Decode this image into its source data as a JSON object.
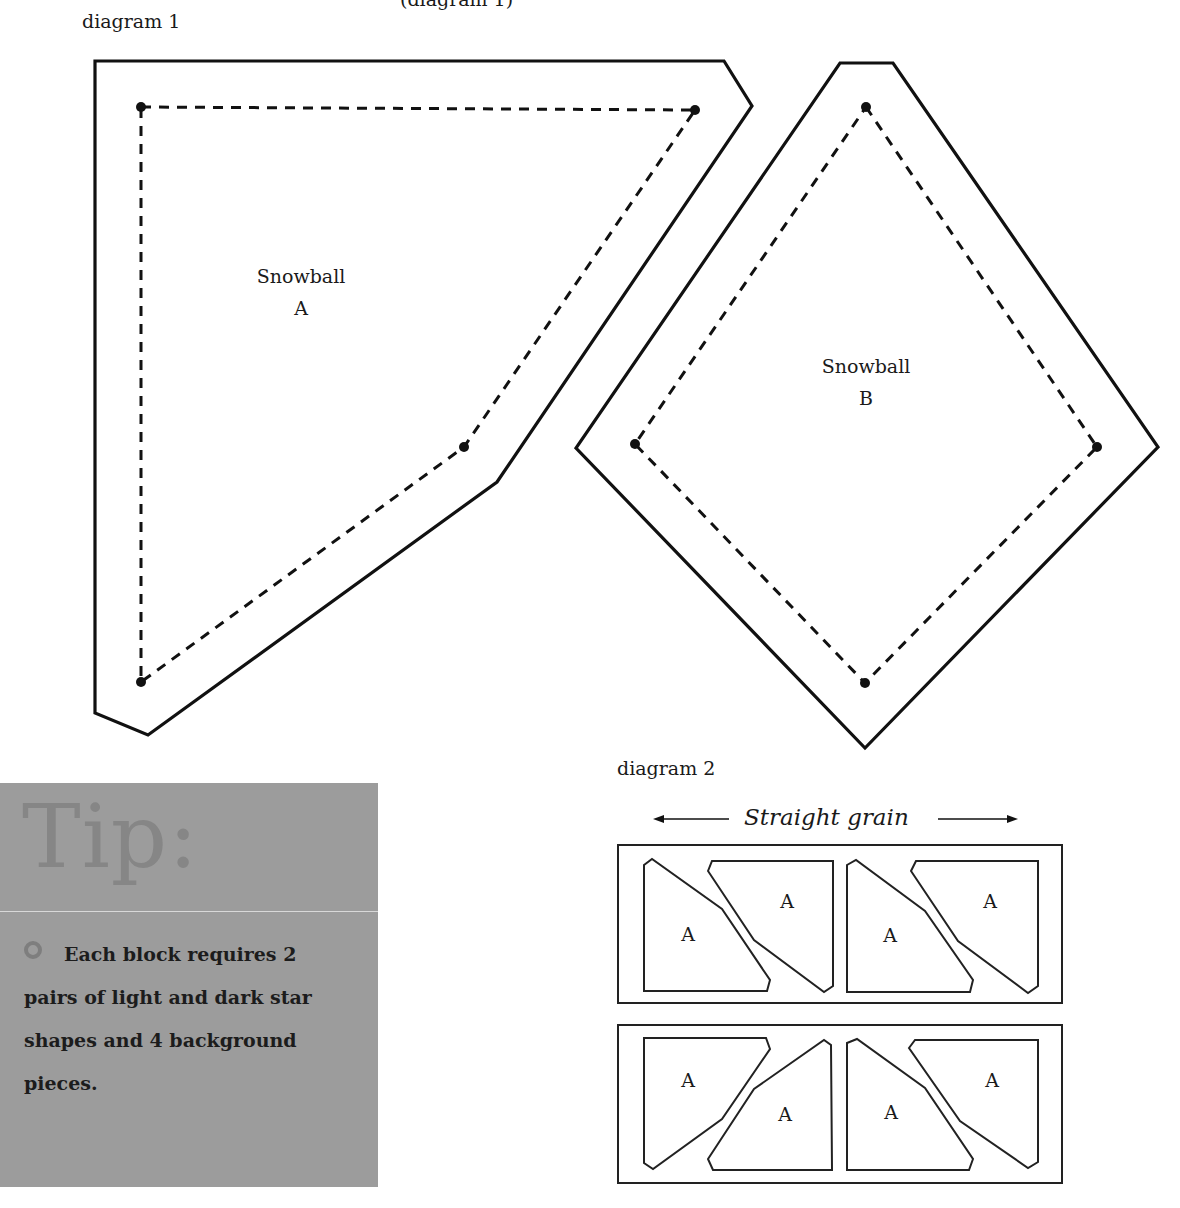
{
  "page": {
    "top_clipped_text": "(diagram 1)"
  },
  "diagram1": {
    "caption": "diagram 1",
    "pieces": [
      {
        "name": "Snowball",
        "letter": "A"
      },
      {
        "name": "Snowball",
        "letter": "B"
      }
    ]
  },
  "tip": {
    "title": "Tip:",
    "bullet_icon": "circle-bullet-icon",
    "text": "Each block requires 2 pairs of light and dark star shapes and 4 background pieces.",
    "colors": {
      "background": "#9c9c9c",
      "title": "#868686",
      "text": "#1c1c1c"
    }
  },
  "diagram2": {
    "caption": "diagram 2",
    "grain_label": "Straight grain",
    "grain_icons": [
      "arrow-left-icon",
      "arrow-right-icon"
    ],
    "rows": [
      {
        "labels": [
          "A",
          "A",
          "A",
          "A"
        ]
      },
      {
        "labels": [
          "A",
          "A",
          "A",
          "A"
        ]
      }
    ]
  }
}
